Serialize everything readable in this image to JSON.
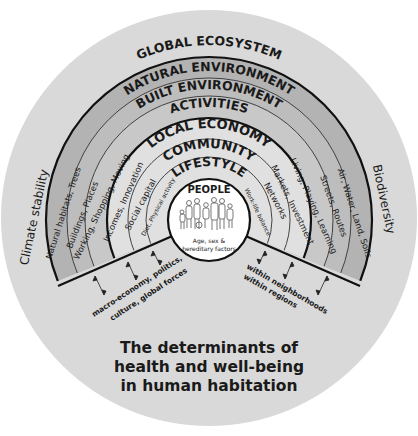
{
  "diagram": {
    "title_lines": [
      "The determinants of",
      "health and well-being",
      "in human habitation"
    ],
    "outer_ring": {
      "label": "GLOBAL ECOSYSTEM",
      "left_label": "Climate stability",
      "right_label": "Biodiversity"
    },
    "layers": [
      {
        "name": "NATURAL ENVIRONMENT",
        "left": "Natural habitats, Trees",
        "right": "Air, Water, Land, Soils"
      },
      {
        "name": "BUILT ENVIRONMENT",
        "left": "Buildings, Places",
        "right": "Streets, Routes"
      },
      {
        "name": "ACTIVITIES",
        "left": "Working, Shopping, Moving",
        "right": "Living, Playing, Learning"
      },
      {
        "name": "LOCAL ECONOMY",
        "left": "Incomes, Innovation",
        "right": "Markets, Investment"
      },
      {
        "name": "COMMUNITY",
        "left": "Social capital",
        "right": "Networks"
      },
      {
        "name": "LIFESTYLE",
        "left": "Diet, Physical activity",
        "right": "Work-life balance"
      }
    ],
    "center": {
      "label": "PEOPLE",
      "sub_lines": [
        "Age, sex &",
        "hereditary factors"
      ]
    },
    "scale_labels": {
      "left_lines": [
        "macro-economy, politics,",
        "culture, global forces"
      ],
      "right_lines": [
        "within neighborhoods",
        "within regions"
      ]
    },
    "colors": {
      "disc": "#d9d9d9",
      "dark_band": "#b3b3b3",
      "mid_band": "#c4c4c4",
      "light_band": "#e3e3e3",
      "center_fill": "#ffffff",
      "line": "#111111"
    }
  }
}
